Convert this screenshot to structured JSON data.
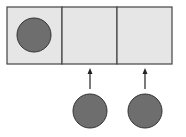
{
  "diagram": {
    "colors": {
      "cell_fill": "#e6e6e6",
      "cell_stroke": "#444444",
      "ball_fill": "#6e6e6e",
      "ball_stroke": "#333333",
      "arrow": "#222222"
    },
    "cells": [
      {
        "id": "cell-1",
        "x": 7,
        "y": 7,
        "w": 55,
        "h": 57,
        "occupied": true
      },
      {
        "id": "cell-2",
        "x": 62,
        "y": 7,
        "w": 55,
        "h": 57,
        "occupied": false
      },
      {
        "id": "cell-3",
        "x": 117,
        "y": 7,
        "w": 55,
        "h": 57,
        "occupied": false
      }
    ],
    "balls": [
      {
        "id": "ball-in-cell-1",
        "cx": 34,
        "cy": 35,
        "r": 17
      },
      {
        "id": "ball-below-cell-2",
        "cx": 90,
        "cy": 111,
        "r": 17
      },
      {
        "id": "ball-below-cell-3",
        "cx": 145,
        "cy": 111,
        "r": 17
      }
    ],
    "arrows": [
      {
        "id": "arrow-to-cell-2",
        "x": 90,
        "y1": 89,
        "y2": 70
      },
      {
        "id": "arrow-to-cell-3",
        "x": 145,
        "y1": 89,
        "y2": 70
      }
    ]
  }
}
